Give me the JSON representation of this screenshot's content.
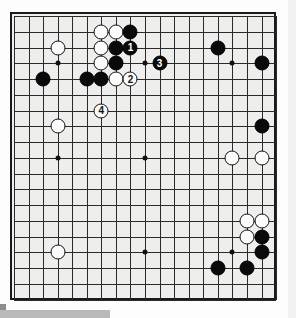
{
  "diagram": {
    "type": "go-board",
    "board_size": 19,
    "colors": {
      "board_background": "#eeeeec",
      "line": "#2a2a2a",
      "black_stone": "#0a0a0a",
      "white_stone": "#fbfbfb",
      "border": "#1a1a1a"
    },
    "geometry": {
      "origin_x": 12,
      "origin_y": 14,
      "step_x": 14.56,
      "step_y": 15.75,
      "stone_diameter": 15
    },
    "star_points": [
      {
        "col": 3,
        "row": 3
      },
      {
        "col": 9,
        "row": 3
      },
      {
        "col": 15,
        "row": 3
      },
      {
        "col": 3,
        "row": 9
      },
      {
        "col": 9,
        "row": 9
      },
      {
        "col": 15,
        "row": 9
      },
      {
        "col": 3,
        "row": 15
      },
      {
        "col": 9,
        "row": 15
      },
      {
        "col": 15,
        "row": 15
      }
    ],
    "moves": [
      {
        "label": "1",
        "color": "black",
        "col": 8,
        "row": 2
      },
      {
        "label": "2",
        "color": "white",
        "col": 8,
        "row": 4
      },
      {
        "label": "3",
        "color": "black",
        "col": 10,
        "row": 3
      },
      {
        "label": "4",
        "color": "white",
        "col": 6,
        "row": 6
      }
    ],
    "stones": [
      {
        "color": "white",
        "col": 6,
        "row": 1
      },
      {
        "color": "white",
        "col": 7,
        "row": 1
      },
      {
        "color": "black",
        "col": 8,
        "row": 1
      },
      {
        "color": "white",
        "col": 6,
        "row": 2
      },
      {
        "color": "black",
        "col": 7,
        "row": 2
      },
      {
        "color": "white",
        "col": 6,
        "row": 3
      },
      {
        "color": "black",
        "col": 7,
        "row": 3
      },
      {
        "color": "black",
        "col": 5,
        "row": 4
      },
      {
        "color": "black",
        "col": 6,
        "row": 4
      },
      {
        "color": "white",
        "col": 7,
        "row": 4
      },
      {
        "color": "white",
        "col": 3,
        "row": 2
      },
      {
        "color": "black",
        "col": 2,
        "row": 4
      },
      {
        "color": "white",
        "col": 3,
        "row": 7
      },
      {
        "color": "white",
        "col": 3,
        "row": 15
      },
      {
        "color": "black",
        "col": 14,
        "row": 2
      },
      {
        "color": "black",
        "col": 17,
        "row": 3
      },
      {
        "color": "black",
        "col": 17,
        "row": 7
      },
      {
        "color": "white",
        "col": 15,
        "row": 9
      },
      {
        "color": "white",
        "col": 17,
        "row": 9
      },
      {
        "color": "white",
        "col": 16,
        "row": 13
      },
      {
        "color": "white",
        "col": 17,
        "row": 13
      },
      {
        "color": "white",
        "col": 16,
        "row": 14
      },
      {
        "color": "black",
        "col": 17,
        "row": 14
      },
      {
        "color": "black",
        "col": 17,
        "row": 15
      },
      {
        "color": "black",
        "col": 16,
        "row": 16
      },
      {
        "color": "black",
        "col": 14,
        "row": 16
      }
    ]
  }
}
